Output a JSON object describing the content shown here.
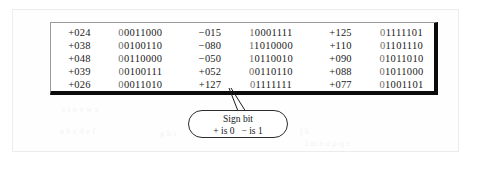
{
  "figure": {
    "kind": "signed-magnitude-binary-table",
    "caption_note": "Sign bit callout attached to leading bit of last binary value"
  },
  "table": {
    "column_pairs": 3,
    "rows": [
      {
        "pairs": [
          {
            "decimal": "+024",
            "binary": "00011000",
            "sign_bit": "0",
            "magnitude": "0011000"
          },
          {
            "decimal": "−015",
            "binary": "10001111",
            "sign_bit": "1",
            "magnitude": "0001111"
          },
          {
            "decimal": "+125",
            "binary": "01111101",
            "sign_bit": "0",
            "magnitude": "1111101"
          }
        ]
      },
      {
        "pairs": [
          {
            "decimal": "+038",
            "binary": "00100110",
            "sign_bit": "0",
            "magnitude": "0100110"
          },
          {
            "decimal": "−080",
            "binary": "11010000",
            "sign_bit": "1",
            "magnitude": "1010000"
          },
          {
            "decimal": "+110",
            "binary": "01101110",
            "sign_bit": "0",
            "magnitude": "1101110"
          }
        ]
      },
      {
        "pairs": [
          {
            "decimal": "+048",
            "binary": "00110000",
            "sign_bit": "0",
            "magnitude": "0110000"
          },
          {
            "decimal": "−050",
            "binary": "10110010",
            "sign_bit": "1",
            "magnitude": "0110010"
          },
          {
            "decimal": "+090",
            "binary": "01011010",
            "sign_bit": "0",
            "magnitude": "1011010"
          }
        ]
      },
      {
        "pairs": [
          {
            "decimal": "+039",
            "binary": "00100111",
            "sign_bit": "0",
            "magnitude": "0100111"
          },
          {
            "decimal": "+052",
            "binary": "00110110",
            "sign_bit": "0",
            "magnitude": "0110110"
          },
          {
            "decimal": "+088",
            "binary": "01011000",
            "sign_bit": "0",
            "magnitude": "1011000"
          }
        ]
      },
      {
        "pairs": [
          {
            "decimal": "+026",
            "binary": "00011010",
            "sign_bit": "0",
            "magnitude": "0011010"
          },
          {
            "decimal": "+127",
            "binary": "01111111",
            "sign_bit": "0",
            "magnitude": "1111111"
          },
          {
            "decimal": "+077",
            "binary": "01001101",
            "sign_bit": "0",
            "magnitude": "1001101"
          }
        ]
      }
    ]
  },
  "callout": {
    "title": "Sign bit",
    "rule_plus": "+ is 0",
    "rule_minus": "− is 1"
  },
  "ghost_text": {
    "lines": [
      "a b c d e f",
      "g h i",
      "j k",
      "l m n o p q r",
      "s t u v w x"
    ]
  },
  "colors": {
    "box_border_dark": "#0b0b0b",
    "box_border_light": "#9b9b9b",
    "text": "#1a1a1a",
    "sign_bit_text": "#6d6d6d",
    "page_background": "#ffffff",
    "outer_frame": "#ececec"
  }
}
